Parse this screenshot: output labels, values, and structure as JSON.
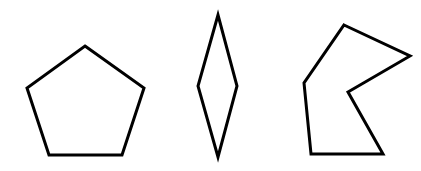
{
  "diagram": {
    "background": "#ffffff",
    "stroke_color": "#000000",
    "stroke_width": 3,
    "shapes": [
      {
        "name": "regular-pentagon",
        "kind": "pentagon",
        "points": "85,46 144,88 122,155 49,155 27,88"
      },
      {
        "name": "rhombus",
        "kind": "quadrilateral",
        "points": "218,15 237,86 218,157 198,86"
      },
      {
        "name": "concave-hexagon",
        "kind": "hexagon",
        "points": "344,25 410,56 348,92 383,154 311,154 304,83"
      }
    ]
  }
}
